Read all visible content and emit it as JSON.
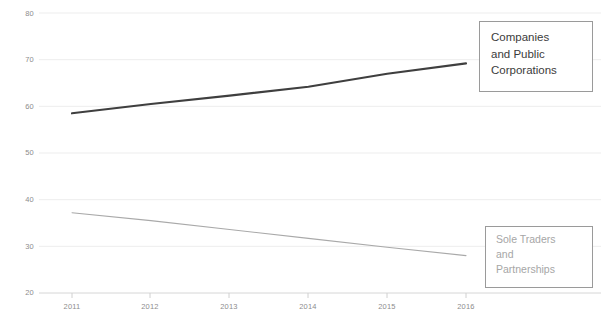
{
  "chart_data": {
    "type": "line",
    "title": "",
    "subtitle": "",
    "xlabel": "",
    "ylabel": "",
    "categories": [
      "2011",
      "2012",
      "2013",
      "2014",
      "2015",
      "2016"
    ],
    "x": [
      2011,
      2012,
      2013,
      2014,
      2015,
      2016
    ],
    "ylim": [
      20,
      80
    ],
    "yticks": [
      "20",
      "30",
      "40",
      "50",
      "60",
      "70",
      "80"
    ],
    "ytick_values": [
      20,
      30,
      40,
      50,
      60,
      70,
      80
    ],
    "grid": true,
    "grid_axis": "y",
    "legend_position": "inside-right",
    "series": [
      {
        "name": "Companies and Public Corporations",
        "values": [
          58.5,
          60.5,
          62.3,
          64.2,
          67.0,
          69.2
        ],
        "color": "#3f3f3f",
        "line_width": 2.1
      },
      {
        "name": "Sole Traders and Partnerships",
        "values": [
          37.2,
          35.5,
          33.6,
          31.7,
          29.8,
          28.0
        ],
        "color": "#a9a9a9",
        "line_width": 1.1
      }
    ]
  },
  "axes": {
    "y_labels": [
      "80",
      "70",
      "60",
      "50",
      "40",
      "30",
      "20"
    ],
    "x_labels": [
      "2011",
      "2012",
      "2013",
      "2014",
      "2015",
      "2016"
    ]
  },
  "legend": {
    "upper": {
      "name": "Companies and Public Corporations",
      "lines": [
        "Companies",
        "and Public",
        "Corporations"
      ]
    },
    "lower": {
      "name": "Sole Traders and Partnerships",
      "lines": [
        "Sole Traders",
        "and",
        "Partnerships"
      ]
    }
  },
  "colors": {
    "series_companies": "#3f3f3f",
    "series_sole_traders": "#a9a9a9",
    "gridline": "#ededed",
    "axis_text": "#8d8d8d",
    "legend_border": "#9a9a9a"
  }
}
